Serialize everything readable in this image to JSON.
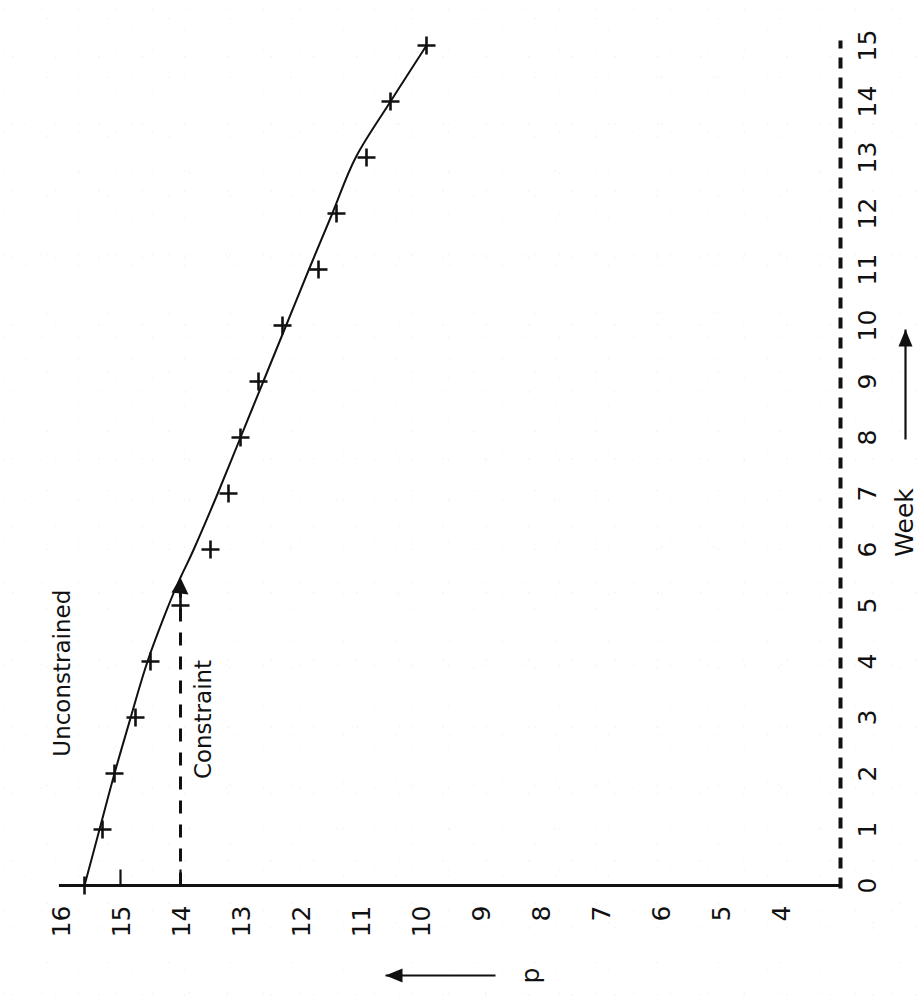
{
  "figure": {
    "orientation": "rotated-90-ccw",
    "ink_color": "#111111",
    "paper_color": "#ffffff"
  },
  "chart_data": {
    "type": "line",
    "title": "",
    "subtitle": "",
    "xlabel": "Week",
    "ylabel": "p",
    "xlabel_arrow": "right-arrow",
    "ylabel_arrow": "left-arrow",
    "grid": false,
    "legend": "none",
    "xlim": [
      0,
      15
    ],
    "ylim": [
      4,
      16
    ],
    "y_axis_direction": "decreasing",
    "xticks": [
      0,
      1,
      2,
      3,
      4,
      5,
      6,
      7,
      8,
      9,
      10,
      11,
      12,
      13,
      14,
      15
    ],
    "xtick_labels": [
      "0",
      "1",
      "2",
      "3",
      "4",
      "5",
      "6",
      "7",
      "8",
      "9",
      "10",
      "11",
      "12",
      "13",
      "14",
      "15"
    ],
    "yticks": [
      16,
      15,
      14,
      13,
      12,
      11,
      10,
      9,
      8,
      7,
      6,
      5,
      4
    ],
    "ytick_labels": [
      "16",
      "15",
      "14",
      "13",
      "12",
      "11",
      "10",
      "9",
      "8",
      "7",
      "6",
      "5",
      "4"
    ],
    "x": [
      0,
      1,
      2,
      3,
      4,
      5,
      6,
      7,
      8,
      9,
      10,
      11,
      12,
      13,
      14,
      15
    ],
    "series": [
      {
        "name": "Unconstrained",
        "style": "solid-line-with-plus-markers",
        "marker": "plus",
        "values": [
          15.6,
          15.3,
          15.1,
          14.75,
          14.5,
          14.0,
          13.5,
          13.2,
          13.0,
          12.7,
          12.3,
          11.7,
          11.4,
          10.9,
          10.5,
          9.9
        ]
      }
    ],
    "fitted_curve": {
      "name": "Unconstrained",
      "x": [
        0,
        1,
        2,
        3,
        4,
        5,
        5.5,
        6,
        7,
        8,
        9,
        10,
        11,
        12,
        13,
        14,
        15
      ],
      "y": [
        15.6,
        15.35,
        15.1,
        14.83,
        14.55,
        14.2,
        14.0,
        13.78,
        13.38,
        13.0,
        12.62,
        12.24,
        11.86,
        11.47,
        11.08,
        10.5,
        9.9
      ]
    },
    "constraint_line": {
      "label": "Constraint",
      "style": "dashed",
      "p_value": 14,
      "x_from": 0,
      "x_to": 5.5,
      "arrowhead_at": "curve-intersection"
    },
    "annotations": [
      {
        "text": "Unconstrained",
        "x": 2.3,
        "y": 15.85,
        "rotation_deg": 0,
        "target": "fitted-curve"
      },
      {
        "text": "Constraint",
        "x": 1.9,
        "y": 13.5,
        "rotation_deg": 0,
        "target": "constraint-line"
      }
    ]
  },
  "labels": {
    "x_axis_title": "Week",
    "y_axis_title": "p",
    "unconstrained": "Unconstrained",
    "constraint": "Constraint"
  },
  "ticks": {
    "x": [
      "0",
      "1",
      "2",
      "3",
      "4",
      "5",
      "6",
      "7",
      "8",
      "9",
      "10",
      "11",
      "12",
      "13",
      "14",
      "15"
    ],
    "y": [
      "16",
      "15",
      "14",
      "13",
      "12",
      "11",
      "10",
      "9",
      "8",
      "7",
      "6",
      "5",
      "4"
    ]
  }
}
